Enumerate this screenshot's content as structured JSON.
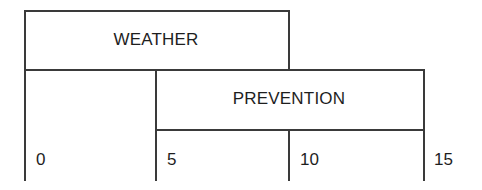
{
  "diagram": {
    "rows": [
      {
        "label": "WEATHER",
        "start": 0,
        "end": 10
      },
      {
        "label": "PREVENTION",
        "start": 5,
        "end": 15
      }
    ],
    "scale_ticks": [
      "0",
      "5",
      "10",
      "15"
    ]
  }
}
